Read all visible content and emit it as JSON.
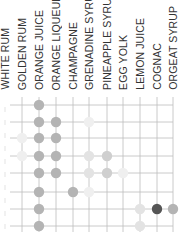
{
  "chart_data": {
    "type": "heatmap",
    "title": "",
    "columns": [
      "WHITE RUM",
      "GOLDEN RUM",
      "ORANGE JUICE",
      "ORANGE LIQUEUR",
      "CHAMPAGNE",
      "GRENADINE SYRUP",
      "PINEAPPLE SYRUP",
      "EGG YOLK",
      "LEMON JUICE",
      "COGNAC",
      "ORGEAT SYRUP"
    ],
    "column_x": [
      5,
      22,
      39,
      56,
      73,
      89,
      107,
      123,
      140,
      157,
      173
    ],
    "row_y": [
      105,
      122,
      138,
      156,
      173,
      192,
      209,
      226
    ],
    "rows": [
      {
        "cells": [
          {
            "col": 2,
            "shade": "medium"
          }
        ]
      },
      {
        "cells": [
          {
            "col": 2,
            "shade": "medium"
          },
          {
            "col": 3,
            "shade": "medium"
          },
          {
            "col": 5,
            "shade": "faint"
          }
        ]
      },
      {
        "cells": [
          {
            "col": 1,
            "shade": "faint"
          },
          {
            "col": 2,
            "shade": "medium"
          },
          {
            "col": 3,
            "shade": "medium"
          }
        ]
      },
      {
        "cells": [
          {
            "col": 1,
            "shade": "faint"
          },
          {
            "col": 2,
            "shade": "medium"
          },
          {
            "col": 3,
            "shade": "medium"
          },
          {
            "col": 5,
            "shade": "light"
          },
          {
            "col": 6,
            "shade": "medium-light"
          }
        ]
      },
      {
        "cells": [
          {
            "col": 2,
            "shade": "medium"
          },
          {
            "col": 3,
            "shade": "medium"
          },
          {
            "col": 5,
            "shade": "light"
          },
          {
            "col": 6,
            "shade": "medium-light"
          },
          {
            "col": 7,
            "shade": "faint"
          }
        ]
      },
      {
        "cells": [
          {
            "col": 2,
            "shade": "medium"
          },
          {
            "col": 4,
            "shade": "medium"
          },
          {
            "col": 5,
            "shade": "faint"
          }
        ]
      },
      {
        "cells": [
          {
            "col": 2,
            "shade": "medium"
          },
          {
            "col": 8,
            "shade": "light"
          },
          {
            "col": 9,
            "shade": "dark"
          },
          {
            "col": 10,
            "shade": "medium"
          }
        ]
      },
      {
        "cells": [
          {
            "col": 2,
            "shade": "medium"
          },
          {
            "col": 8,
            "shade": "light"
          }
        ]
      }
    ],
    "shades": {
      "dark": "#555555",
      "medium": "#b4b4b4",
      "medium-light": "#cfcfcf",
      "light": "#e3e3e3",
      "faint": "#efefef"
    },
    "grid": true,
    "grid_color": "#bdbdbd",
    "legend": null
  }
}
